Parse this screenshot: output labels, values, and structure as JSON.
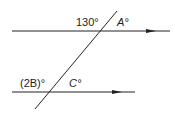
{
  "diagram": {
    "labels": {
      "angle_top_left": "130°",
      "angle_top_right": "A°",
      "angle_bottom_left": "(2B)°",
      "angle_bottom_right": "C°"
    }
  }
}
